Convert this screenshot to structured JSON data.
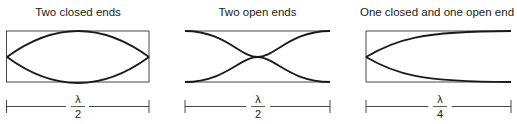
{
  "panels": [
    {
      "title": "Two closed ends",
      "numerator": "λ",
      "denominator": "2",
      "boundary": "closed-closed"
    },
    {
      "title": "Two open ends",
      "numerator": "λ",
      "denominator": "2",
      "boundary": "open-open"
    },
    {
      "title": "One closed and one open end",
      "numerator": "λ",
      "denominator": "4",
      "boundary": "closed-open"
    }
  ],
  "colors": {
    "stroke": "#1a1a1a",
    "frame": "#333333",
    "background": "#ffffff"
  }
}
